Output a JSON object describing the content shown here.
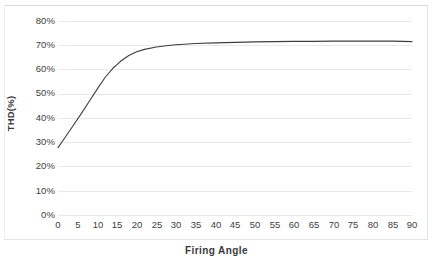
{
  "chart_data": {
    "type": "line",
    "title": "",
    "xlabel": "Firing Angle",
    "ylabel": "THD(%)",
    "xlim": [
      0,
      90
    ],
    "ylim": [
      0,
      80
    ],
    "grid": true,
    "legend": "none",
    "x_ticks": [
      "0",
      "5",
      "10",
      "15",
      "20",
      "25",
      "30",
      "35",
      "40",
      "45",
      "50",
      "55",
      "60",
      "65",
      "70",
      "75",
      "80",
      "85",
      "90"
    ],
    "y_ticks": [
      "0%",
      "10%",
      "20%",
      "30%",
      "40%",
      "50%",
      "60%",
      "70%",
      "80%"
    ],
    "line_color": "#3f3f3f",
    "grid_color": "#e9e9e9",
    "series": [
      {
        "name": "THD",
        "x": [
          0,
          2,
          4,
          6,
          8,
          10,
          12,
          14,
          15,
          16,
          18,
          20,
          22,
          25,
          28,
          30,
          35,
          40,
          45,
          50,
          55,
          60,
          65,
          70,
          75,
          80,
          85,
          90
        ],
        "values": [
          27.8,
          32.5,
          37.2,
          42.0,
          47.0,
          52.0,
          56.8,
          60.6,
          62.0,
          63.5,
          65.8,
          67.3,
          68.3,
          69.3,
          69.9,
          70.2,
          70.7,
          71.0,
          71.2,
          71.4,
          71.5,
          71.6,
          71.6,
          71.7,
          71.7,
          71.7,
          71.7,
          71.5
        ]
      }
    ]
  }
}
